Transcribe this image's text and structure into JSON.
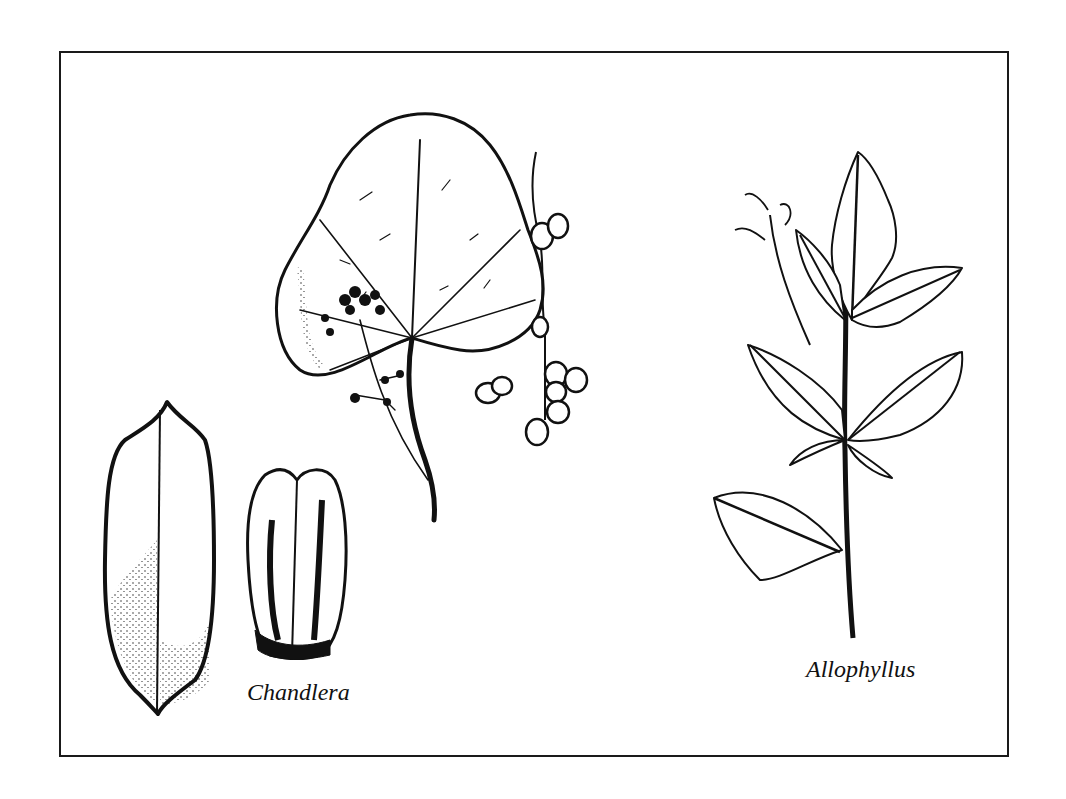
{
  "figure": {
    "border_color": "#1a1a1a",
    "ink_color": "#111111",
    "background": "#ffffff"
  },
  "specimens": [
    {
      "id": "chandlera",
      "label": "Chandlera",
      "parts": [
        "fruit-whole",
        "fruit-segmented"
      ]
    },
    {
      "id": "central-plant",
      "label": "",
      "parts": [
        "cordate-leaf",
        "flower-cluster",
        "berry-cluster"
      ]
    },
    {
      "id": "allophyllus",
      "label": "Allophyllus",
      "parts": [
        "compound-leaf-branch",
        "flower-sprig"
      ]
    }
  ]
}
